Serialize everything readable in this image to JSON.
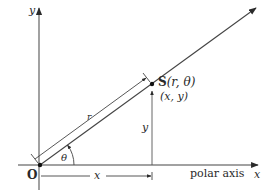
{
  "diagram": {
    "type": "polar-coordinates-illustration",
    "labels": {
      "origin": "O",
      "y_axis": "y",
      "x_axis": "x",
      "polar_axis": "polar axis",
      "point_name": "S",
      "point_polar": "(r, θ)",
      "point_cartesian": "(x, y)",
      "radius": "r",
      "angle": "θ",
      "x_length": "x",
      "y_length": "y"
    },
    "colors": {
      "line": "#3a3a3a",
      "text": "#2a2a2a",
      "background": "#ffffff"
    }
  }
}
